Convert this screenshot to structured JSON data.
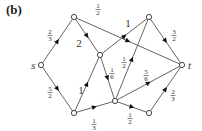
{
  "panel_label": "(b)",
  "colors": {
    "edge": "#555555",
    "node_fill": "#ffffff",
    "node_stroke": "#444444",
    "text": "#333333"
  },
  "nodes": [
    {
      "id": "s",
      "label": "s",
      "x": 41,
      "y": 65,
      "label_dx": -10,
      "label_dy": 4
    },
    {
      "id": "A",
      "label": "",
      "x": 74,
      "y": 17
    },
    {
      "id": "B",
      "label": "",
      "x": 100,
      "y": 55
    },
    {
      "id": "C",
      "label": "",
      "x": 149,
      "y": 17
    },
    {
      "id": "D",
      "label": "",
      "x": 74,
      "y": 113
    },
    {
      "id": "E",
      "label": "",
      "x": 115,
      "y": 101
    },
    {
      "id": "F",
      "label": "",
      "x": 149,
      "y": 113
    },
    {
      "id": "t",
      "label": "t",
      "x": 182,
      "y": 65,
      "label_dx": 6,
      "label_dy": 4
    }
  ],
  "edges": [
    {
      "from": "s",
      "to": "A",
      "weight": "2/3",
      "lx": 50,
      "ly": 36
    },
    {
      "from": "s",
      "to": "D",
      "weight": "5/2",
      "lx": 50,
      "ly": 93
    },
    {
      "from": "A",
      "to": "B",
      "weight": "2",
      "lx": 79,
      "ly": 44
    },
    {
      "from": "A",
      "to": "t",
      "weight": "1/2",
      "lx": 98,
      "ly": 10
    },
    {
      "from": "B",
      "to": "C",
      "weight": "1",
      "lx": 128,
      "ly": 24
    },
    {
      "from": "B",
      "to": "E",
      "weight": "1/6",
      "lx": 112,
      "ly": 74
    },
    {
      "from": "D",
      "to": "B",
      "weight": "1",
      "lx": 81,
      "ly": 91
    },
    {
      "from": "D",
      "to": "E",
      "weight": "1/3",
      "lx": 94,
      "ly": 125
    },
    {
      "from": "E",
      "to": "C",
      "weight": "1/2",
      "lx": 124,
      "ly": 63
    },
    {
      "from": "E",
      "to": "t",
      "weight": "5/6",
      "lx": 146,
      "ly": 76
    },
    {
      "from": "C",
      "to": "t",
      "weight": "3/2",
      "lx": 174,
      "ly": 36
    },
    {
      "from": "F",
      "to": "t",
      "weight": "2/3",
      "lx": 173,
      "ly": 96
    },
    {
      "from": "E",
      "to": "F",
      "weight": "1/2",
      "lx": 130,
      "ly": 119
    }
  ]
}
